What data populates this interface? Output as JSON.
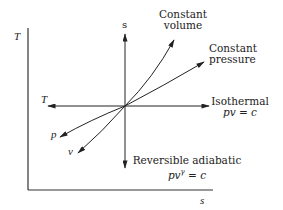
{
  "diagram": {
    "axes": {
      "y_label": "T",
      "x_label": "s"
    },
    "processes": {
      "constant_volume": {
        "line1": "Constant",
        "line2": "volume"
      },
      "constant_pressure": {
        "line1": "Constant",
        "line2": "pressure"
      },
      "isothermal": {
        "line1": "Isothermal",
        "eq_a": "pv",
        "eq_b": " = c"
      },
      "adiabatic": {
        "line1": "Reversible adiabatic",
        "eq_a": "pv",
        "eq_sup": "γ",
        "eq_b": " = c"
      }
    },
    "direction_labels": {
      "up": "s",
      "left": "T",
      "p": "p",
      "v": "v"
    },
    "colors": {
      "ink": "#222222",
      "background": "#ffffff"
    }
  }
}
